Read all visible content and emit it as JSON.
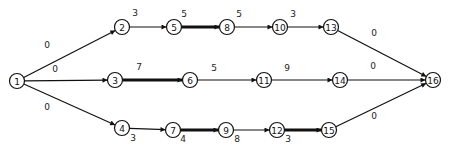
{
  "diagram": {
    "type": "activity-network",
    "nodes": [
      {
        "id": "1",
        "label": "1",
        "x": 17,
        "y": 81
      },
      {
        "id": "2",
        "label": "2",
        "x": 122,
        "y": 27
      },
      {
        "id": "5",
        "label": "5",
        "x": 174,
        "y": 27
      },
      {
        "id": "8",
        "label": "8",
        "x": 227,
        "y": 27
      },
      {
        "id": "10",
        "label": "10",
        "x": 280,
        "y": 27
      },
      {
        "id": "13",
        "label": "13",
        "x": 331,
        "y": 27
      },
      {
        "id": "3",
        "label": "3",
        "x": 115,
        "y": 80
      },
      {
        "id": "6",
        "label": "6",
        "x": 190,
        "y": 80
      },
      {
        "id": "11",
        "label": "11",
        "x": 264,
        "y": 80
      },
      {
        "id": "14",
        "label": "14",
        "x": 340,
        "y": 80
      },
      {
        "id": "16",
        "label": "16",
        "x": 433,
        "y": 80
      },
      {
        "id": "4",
        "label": "4",
        "x": 122,
        "y": 128
      },
      {
        "id": "7",
        "label": "7",
        "x": 173,
        "y": 130
      },
      {
        "id": "9",
        "label": "9",
        "x": 226,
        "y": 130
      },
      {
        "id": "12",
        "label": "12",
        "x": 277,
        "y": 130
      },
      {
        "id": "15",
        "label": "15",
        "x": 329,
        "y": 130
      }
    ],
    "edges": [
      {
        "from": "1",
        "to": "2",
        "weight": "0",
        "critical": false,
        "lx": 47,
        "ly": 45
      },
      {
        "from": "1",
        "to": "3",
        "weight": "0",
        "critical": false,
        "lx": 55,
        "ly": 69
      },
      {
        "from": "1",
        "to": "4",
        "weight": "0",
        "critical": false,
        "lx": 47,
        "ly": 107
      },
      {
        "from": "2",
        "to": "5",
        "weight": "3",
        "critical": false,
        "lx": 135,
        "ly": 13
      },
      {
        "from": "5",
        "to": "8",
        "weight": "5",
        "critical": true,
        "lx": 184,
        "ly": 14
      },
      {
        "from": "8",
        "to": "10",
        "weight": "5",
        "critical": false,
        "lx": 239,
        "ly": 14
      },
      {
        "from": "10",
        "to": "13",
        "weight": "3",
        "critical": false,
        "lx": 293,
        "ly": 14
      },
      {
        "from": "13",
        "to": "16",
        "weight": "0",
        "critical": false,
        "lx": 374,
        "ly": 33
      },
      {
        "from": "3",
        "to": "6",
        "weight": "7",
        "critical": true,
        "lx": 139,
        "ly": 67
      },
      {
        "from": "6",
        "to": "11",
        "weight": "5",
        "critical": false,
        "lx": 214,
        "ly": 68
      },
      {
        "from": "11",
        "to": "14",
        "weight": "9",
        "critical": false,
        "lx": 287,
        "ly": 68
      },
      {
        "from": "14",
        "to": "16",
        "weight": "0",
        "critical": false,
        "lx": 373,
        "ly": 66
      },
      {
        "from": "4",
        "to": "7",
        "weight": "3",
        "critical": false,
        "lx": 133,
        "ly": 138
      },
      {
        "from": "7",
        "to": "9",
        "weight": "4",
        "critical": true,
        "lx": 183,
        "ly": 139
      },
      {
        "from": "9",
        "to": "12",
        "weight": "8",
        "critical": false,
        "lx": 237,
        "ly": 139
      },
      {
        "from": "12",
        "to": "15",
        "weight": "3",
        "critical": true,
        "lx": 288,
        "ly": 139
      },
      {
        "from": "15",
        "to": "16",
        "weight": "0",
        "critical": false,
        "lx": 374,
        "ly": 116
      }
    ]
  },
  "colors": {
    "stroke": "#111111",
    "background": "#ffffff"
  }
}
